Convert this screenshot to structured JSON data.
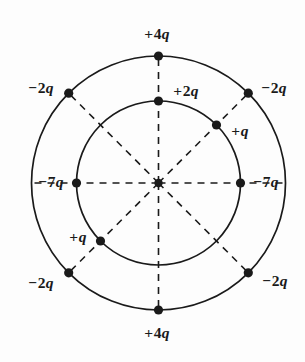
{
  "figure": {
    "background_color": "#fdfdfd",
    "stroke_color": "#1a1a1a",
    "center": {
      "x": 158.5,
      "y": 183
    },
    "outer_circle": {
      "radius": 127,
      "style": "solid"
    },
    "inner_circle": {
      "radius": 82,
      "style": "solid"
    },
    "spokes": {
      "style": "dashed",
      "count": 8,
      "angles_deg": [
        0,
        45,
        90,
        135,
        180,
        225,
        270,
        315
      ]
    },
    "charges": [
      {
        "id": "outer-top",
        "sign": "+",
        "magnitude": "4",
        "symbol": "q",
        "label": "+4q",
        "ring": "outer",
        "angle_deg": 90,
        "dot": {
          "x": 158.5,
          "y": 56
        },
        "label_pos": {
          "x": 157,
          "y": 34
        }
      },
      {
        "id": "outer-top-left",
        "sign": "−",
        "magnitude": "2",
        "symbol": "q",
        "label": "−2q",
        "ring": "outer",
        "angle_deg": 135,
        "dot": {
          "x": 68.7,
          "y": 93.2
        },
        "label_pos": {
          "x": 41,
          "y": 88
        }
      },
      {
        "id": "outer-top-right",
        "sign": "−",
        "magnitude": "2",
        "symbol": "q",
        "label": "−2q",
        "ring": "outer",
        "angle_deg": 45,
        "dot": {
          "x": 248.3,
          "y": 93.2
        },
        "label_pos": {
          "x": 274,
          "y": 88
        }
      },
      {
        "id": "outer-bottom-left",
        "sign": "−",
        "magnitude": "2",
        "symbol": "q",
        "label": "−2q",
        "ring": "outer",
        "angle_deg": 225,
        "dot": {
          "x": 68.7,
          "y": 272.8
        },
        "label_pos": {
          "x": 41,
          "y": 283
        }
      },
      {
        "id": "outer-bottom-right",
        "sign": "−",
        "magnitude": "2",
        "symbol": "q",
        "label": "−2q",
        "ring": "outer",
        "angle_deg": 315,
        "dot": {
          "x": 248.3,
          "y": 272.8
        },
        "label_pos": {
          "x": 275,
          "y": 281
        }
      },
      {
        "id": "outer-bottom",
        "sign": "+",
        "magnitude": "4",
        "symbol": "q",
        "label": "+4q",
        "ring": "outer",
        "angle_deg": 270,
        "dot": {
          "x": 158.5,
          "y": 310
        },
        "label_pos": {
          "x": 157,
          "y": 333
        }
      },
      {
        "id": "inner-top",
        "sign": "+",
        "magnitude": "2",
        "symbol": "q",
        "label": "+2q",
        "ring": "inner",
        "angle_deg": 90,
        "dot": {
          "x": 158.5,
          "y": 101
        },
        "label_pos": {
          "x": 186,
          "y": 91
        }
      },
      {
        "id": "inner-top-right",
        "sign": "+",
        "magnitude": "",
        "symbol": "q",
        "label": "+q",
        "ring": "inner",
        "angle_deg": 45,
        "dot": {
          "x": 216.5,
          "y": 125
        },
        "label_pos": {
          "x": 240,
          "y": 131
        }
      },
      {
        "id": "inner-left",
        "sign": "−",
        "magnitude": "7",
        "symbol": "q",
        "label": "−7q",
        "ring": "inner",
        "angle_deg": 180,
        "dot": {
          "x": 76.5,
          "y": 183
        },
        "label_pos": {
          "x": 51,
          "y": 182
        }
      },
      {
        "id": "inner-right",
        "sign": "−",
        "magnitude": "7",
        "symbol": "q",
        "label": "−7q",
        "ring": "inner",
        "angle_deg": 0,
        "dot": {
          "x": 240.5,
          "y": 183
        },
        "label_pos": {
          "x": 266,
          "y": 182
        }
      },
      {
        "id": "inner-bottom-left",
        "sign": "+",
        "magnitude": "",
        "symbol": "q",
        "label": "+q",
        "ring": "inner",
        "angle_deg": 225,
        "dot": {
          "x": 100.5,
          "y": 241
        },
        "label_pos": {
          "x": 78,
          "y": 237
        }
      }
    ]
  }
}
